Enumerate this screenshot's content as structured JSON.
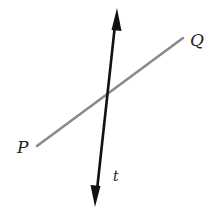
{
  "diagram": {
    "type": "geometry-lines",
    "lines": [
      {
        "id": "PQ",
        "endpoints": [
          {
            "label": "P",
            "x": 37,
            "y": 146
          },
          {
            "label": "Q",
            "x": 183,
            "y": 38
          }
        ],
        "color": "#8a8a8a",
        "arrows": false
      },
      {
        "id": "t",
        "start": {
          "x": 95,
          "y": 207
        },
        "end": {
          "x": 117,
          "y": 8
        },
        "color": "#111111",
        "arrows": "both"
      }
    ],
    "labels": {
      "P": "P",
      "Q": "Q",
      "t": "t"
    }
  }
}
